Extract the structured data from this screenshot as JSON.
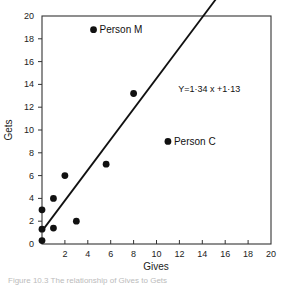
{
  "chart_data": {
    "type": "scatter",
    "title": "",
    "xlabel": "Gives",
    "ylabel": "Gets",
    "xlim": [
      0,
      20
    ],
    "ylim": [
      0,
      20
    ],
    "x_ticks": [
      2,
      4,
      6,
      8,
      10,
      12,
      14,
      16,
      18,
      20
    ],
    "x_tick_labels": [
      "2",
      "4",
      "6",
      "8",
      "10",
      "12",
      "14",
      "16",
      "18",
      "20"
    ],
    "y_ticks": [
      0,
      2,
      4,
      6,
      8,
      10,
      12,
      14,
      16,
      18,
      20
    ],
    "y_tick_labels": [
      "0",
      "2",
      "4",
      "6",
      "8",
      "10",
      "12",
      "14",
      "16",
      "18",
      "20"
    ],
    "grid": false,
    "legend": null,
    "points": [
      {
        "x": 0,
        "y": 0.3
      },
      {
        "x": 0,
        "y": 1.3
      },
      {
        "x": 0,
        "y": 3
      },
      {
        "x": 1,
        "y": 1.4
      },
      {
        "x": 1,
        "y": 4
      },
      {
        "x": 2,
        "y": 6
      },
      {
        "x": 3,
        "y": 2
      },
      {
        "x": 5.6,
        "y": 7
      },
      {
        "x": 8,
        "y": 13.2
      },
      {
        "x": 4.5,
        "y": 18.8,
        "label": "Person M"
      },
      {
        "x": 11,
        "y": 9,
        "label": "Person C"
      }
    ],
    "regression": {
      "slope": 1.34,
      "intercept": 1.13,
      "x_range": [
        0,
        16.1
      ],
      "equation_label": "Y=1·34 x +1·13"
    },
    "annotations": [
      {
        "text": "Person M",
        "x": 4.5,
        "y": 18.8
      },
      {
        "text": "Person C",
        "x": 11,
        "y": 9
      },
      {
        "text": "Y=1·34 x +1·13",
        "x": 11.9,
        "y": 13.6
      }
    ]
  },
  "caption": "Figure 10.3 The relationship of Gives to Gets"
}
